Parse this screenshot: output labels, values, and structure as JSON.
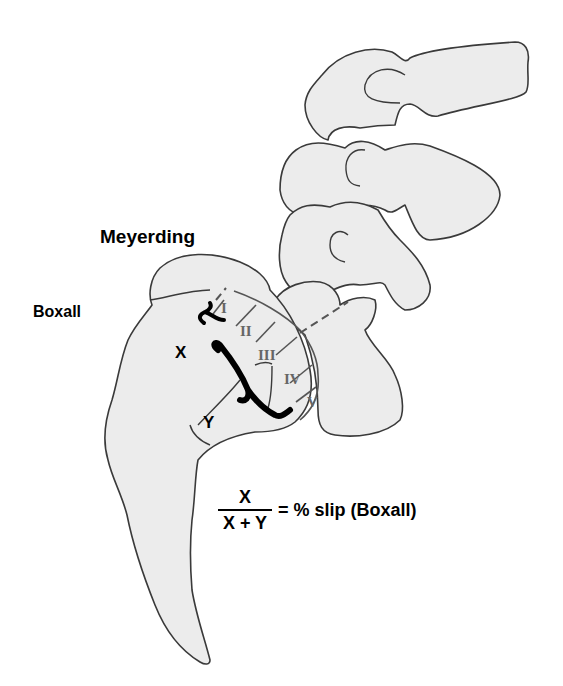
{
  "diagram": {
    "type": "spondylolisthesis grading illustration",
    "labels": {
      "meyerding": "Meyerding",
      "boxall": "Boxall",
      "x": "X",
      "y": "Y"
    },
    "meyerding_grades": [
      "I",
      "II",
      "III",
      "IV",
      "V"
    ],
    "formula": {
      "numerator": "X",
      "denominator": "X + Y",
      "rhs": "= % slip (Boxall)"
    },
    "colors": {
      "bone_fill": "#ececec",
      "outline": "#3a3a3a",
      "grade_text": "#666666",
      "label_text": "#000000"
    }
  }
}
